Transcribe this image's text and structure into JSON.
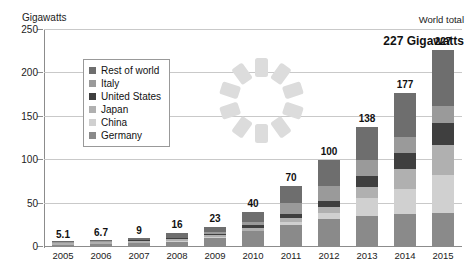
{
  "chart_data": {
    "type": "bar",
    "title": "",
    "subtitle": "",
    "unit_label": "Gigawatts",
    "xlabel": "",
    "ylabel": "Gigawatts",
    "ylim": [
      0,
      250
    ],
    "yticks": [
      0,
      50,
      100,
      150,
      200,
      250
    ],
    "grid": true,
    "stacked": true,
    "legend_position": "inside-upper-left",
    "categories": [
      "2005",
      "2006",
      "2007",
      "2008",
      "2009",
      "2010",
      "2011",
      "2012",
      "2013",
      "2014",
      "2015"
    ],
    "totals": [
      "5.1",
      "6.7",
      "9",
      "16",
      "23",
      "40",
      "70",
      "100",
      "138",
      "177",
      "227"
    ],
    "total_values": [
      5.1,
      6.7,
      9,
      16,
      23,
      40,
      70,
      100,
      138,
      177,
      227
    ],
    "series": [
      {
        "name": "Germany",
        "color": "#8a8a8a",
        "values": [
          2.0,
          2.9,
          4.2,
          6.2,
          10.6,
          17.9,
          25.4,
          32.6,
          36.3,
          38.2,
          39.7
        ]
      },
      {
        "name": "China",
        "color": "#d0d0d0",
        "values": [
          0.1,
          0.1,
          0.1,
          0.2,
          0.3,
          0.9,
          3.3,
          7.0,
          19.7,
          28.2,
          43.5
        ]
      },
      {
        "name": "Japan",
        "color": "#b0b0b0",
        "values": [
          1.4,
          1.7,
          1.9,
          2.1,
          2.6,
          3.6,
          4.9,
          6.6,
          13.6,
          23.3,
          34.4
        ]
      },
      {
        "name": "United States",
        "color": "#3f3f3f",
        "values": [
          0.5,
          0.6,
          0.8,
          1.2,
          1.6,
          2.5,
          4.4,
          7.3,
          12.1,
          18.3,
          25.6
        ]
      },
      {
        "name": "Italy",
        "color": "#9a9a9a",
        "values": [
          0.1,
          0.1,
          0.1,
          0.5,
          1.3,
          3.5,
          12.8,
          16.4,
          18.2,
          18.6,
          18.9
        ]
      },
      {
        "name": "Rest of world",
        "color": "#6e6e6e",
        "values": [
          1.0,
          1.3,
          1.9,
          5.8,
          6.6,
          11.6,
          19.2,
          30.1,
          38.1,
          50.4,
          64.9
        ]
      }
    ],
    "legend": [
      {
        "label": "Rest of world",
        "color": "#6e6e6e"
      },
      {
        "label": "Italy",
        "color": "#9a9a9a"
      },
      {
        "label": "United States",
        "color": "#3f3f3f"
      },
      {
        "label": "Japan",
        "color": "#b0b0b0"
      },
      {
        "label": "China",
        "color": "#d0d0d0"
      },
      {
        "label": "Germany",
        "color": "#8a8a8a"
      }
    ],
    "annotations": {
      "world_total_label": "World total",
      "world_total_value": "227 Gigawatts"
    },
    "decoration": {
      "name": "sun-icon",
      "rays": 10,
      "color": "#dcdcdc"
    }
  }
}
